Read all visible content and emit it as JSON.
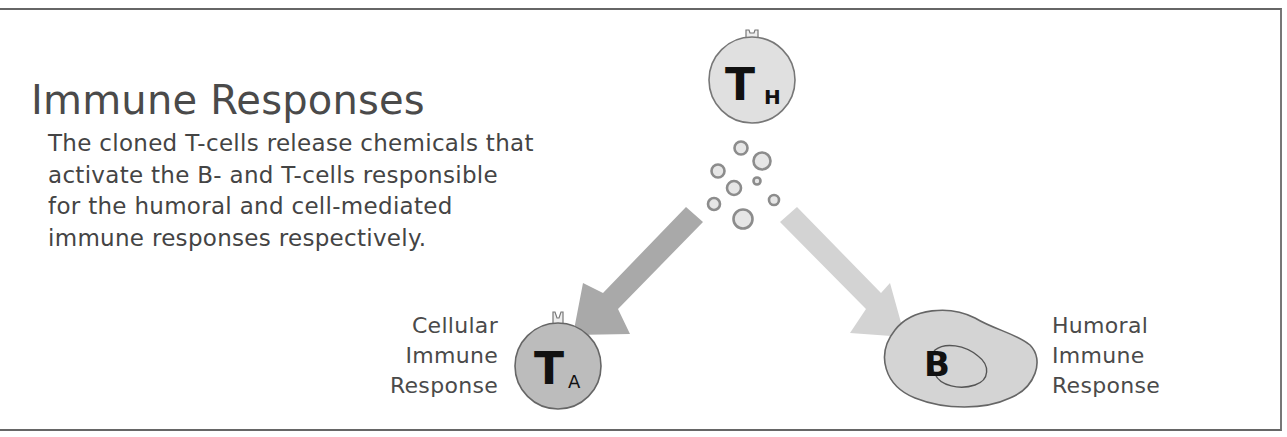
{
  "title": "Immune Responses",
  "description": {
    "lines": [
      "The cloned T-cells release chemicals that",
      "activate the B- and T-cells responsible",
      "for the humoral and cell-mediated",
      "immune responses respectively."
    ]
  },
  "cells": {
    "helper_t": {
      "letter": "T",
      "subscript": "H",
      "fill": "#e0e0e0"
    },
    "activated_t": {
      "letter": "T",
      "subscript": "A",
      "fill": "#bcbcbc"
    },
    "b_cell": {
      "letter": "B",
      "fill": "#d4d4d4"
    }
  },
  "labels": {
    "cellular": [
      "Cellular",
      "Immune",
      "Response"
    ],
    "humoral": [
      "Humoral",
      "Immune",
      "Response"
    ]
  },
  "arrows": {
    "to_cellular": {
      "color": "#a9a9a9"
    },
    "to_humoral": {
      "color": "#d3d3d3"
    }
  },
  "colors": {
    "text": "#4a4a4a",
    "outline": "#666666",
    "particle_stroke": "#8c8c8c",
    "particle_fill": "#e6e6e6"
  }
}
